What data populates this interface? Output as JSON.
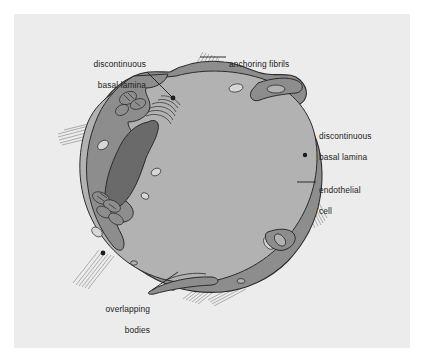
{
  "figure": {
    "panel_background": "#ececec",
    "page_background": "#ffffff"
  },
  "palette": {
    "lumen": "#b2b2b2",
    "cytoplasm": "#8d8d8d",
    "nucleus": "#6a6a6a",
    "outline": "#2b2b2b",
    "vesicle": "#d7d7d7",
    "fibril": "#9a9a9a",
    "label_text": "#1c1c1c",
    "leader_line": "#1c1c1c"
  },
  "labels": [
    {
      "id": "discontinuous-basal-lamina-top",
      "line1": "discontinuous",
      "line2": "basal lamina",
      "align": "right",
      "x": 78,
      "y": 52
    },
    {
      "id": "anchoring-fibrils",
      "line1": "anchoring fibrils",
      "line2": "",
      "align": "left",
      "x": 229,
      "y": 52
    },
    {
      "id": "discontinuous-basal-lamina-right",
      "line1": "discontinuous",
      "line2": "basal lamina",
      "align": "left",
      "x": 319,
      "y": 124
    },
    {
      "id": "endothelial-cell",
      "line1": "endothelial",
      "line2": "cell",
      "align": "left",
      "x": 319,
      "y": 178
    },
    {
      "id": "overlapping-bodies",
      "line1": "overlapping",
      "line2": "bodies",
      "align": "right",
      "x": 112,
      "y": 297
    }
  ],
  "leader_lines": [
    {
      "id": "leader-basal-lamina-top",
      "x1": 147,
      "y1": 72,
      "x2": 172,
      "y2": 97
    },
    {
      "id": "leader-anchoring-fibrils",
      "x1": 226,
      "y1": 57,
      "x2": 200,
      "y2": 57
    },
    {
      "id": "leader-endothelial-cell",
      "x1": 316,
      "y1": 182,
      "x2": 297,
      "y2": 182
    },
    {
      "id": "leader-overlapping-bodies",
      "x1": 152,
      "y1": 290,
      "x2": 178,
      "y2": 272
    }
  ],
  "structures": [
    {
      "id": "lumen",
      "name": "capillary-lumen"
    },
    {
      "id": "endothelial-wall",
      "name": "endothelial-cell-wall"
    },
    {
      "id": "nucleus",
      "name": "nucleus"
    },
    {
      "id": "golgi",
      "name": "golgi-apparatus"
    },
    {
      "id": "mitochondria",
      "name": "mitochondria"
    },
    {
      "id": "vesicles",
      "name": "pinocytotic-vesicles"
    },
    {
      "id": "basal-gaps",
      "name": "basal-lamina-gaps"
    },
    {
      "id": "fibrils",
      "name": "anchoring-fibrils"
    },
    {
      "id": "overlap-flaps",
      "name": "overlapping-bodies"
    }
  ]
}
